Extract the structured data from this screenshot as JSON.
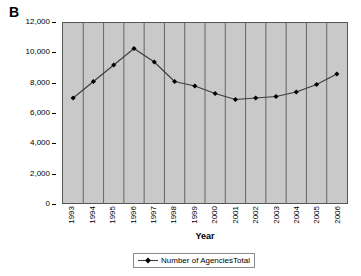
{
  "panel": {
    "label": "B"
  },
  "axis": {
    "x_title": "Year",
    "y_tick_labels": [
      "12,000",
      "10,000",
      "8,000",
      "6,000",
      "4,000",
      "2,000",
      "0"
    ]
  },
  "legend": {
    "entries": [
      {
        "label": "Number of AgenciesTotal",
        "marker": "diamond-marker",
        "color": "#000000"
      }
    ]
  },
  "colors": {
    "plot_background": "#c9c9c9",
    "gridline": "#4a4a4a",
    "series_line": "#3d3d3d",
    "marker": "#000000",
    "frame": "#555555",
    "text": "#000000"
  },
  "chart_data": {
    "type": "line",
    "title": "",
    "subtitle": "",
    "xlabel": "Year",
    "ylabel": "",
    "categories": [
      "1993",
      "1994",
      "1995",
      "1996",
      "1997",
      "1998",
      "1999",
      "2000",
      "2001",
      "2002",
      "2003",
      "2004",
      "2005",
      "2006"
    ],
    "x": [
      1993,
      1994,
      1995,
      1996,
      1997,
      1998,
      1999,
      2000,
      2001,
      2002,
      2003,
      2004,
      2005,
      2006
    ],
    "series": [
      {
        "name": "Number of AgenciesTotal",
        "values": [
          7000,
          8100,
          9200,
          10300,
          9400,
          8100,
          7800,
          7300,
          6900,
          7000,
          7100,
          7400,
          7900,
          8600
        ],
        "color": "#000000",
        "marker": "diamond"
      }
    ],
    "ylim": [
      0,
      12000
    ],
    "y_ticks": [
      0,
      2000,
      4000,
      6000,
      8000,
      10000,
      12000
    ],
    "grid": {
      "vertical": true,
      "horizontal": false
    },
    "legend_position": "bottom"
  }
}
